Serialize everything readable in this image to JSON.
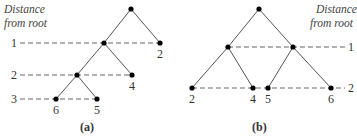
{
  "figure": {
    "a": {
      "caption": "(a)",
      "axis_title": [
        "Distance",
        "from root"
      ],
      "levels": [
        "1",
        "2",
        "3"
      ],
      "leaves": [
        "2",
        "4",
        "6",
        "5"
      ]
    },
    "b": {
      "caption": "(b)",
      "axis_title": [
        "Distance",
        "from root"
      ],
      "levels": [
        "1",
        "2"
      ],
      "leaves": [
        "2",
        "4",
        "5",
        "6"
      ]
    }
  }
}
